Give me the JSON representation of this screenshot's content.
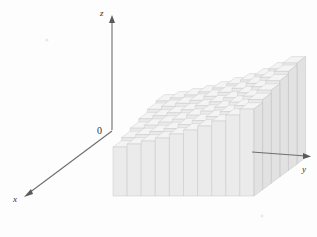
{
  "figure": {
    "background_color": "#fdfdfd",
    "width": 317,
    "height": 237
  },
  "axes": {
    "origin_label": "0",
    "origin_px": {
      "x": 112,
      "y": 130
    },
    "z": {
      "label": "z",
      "label_px": {
        "x": 103,
        "y": 13
      },
      "from_px": {
        "x": 112,
        "y": 130
      },
      "to_px": {
        "x": 112,
        "y": 18
      },
      "arrow": "up"
    },
    "y": {
      "label": "y",
      "label_px": {
        "x": 305,
        "y": 170
      },
      "from_px": {
        "x": 253,
        "y": 152
      },
      "to_px": {
        "x": 311,
        "y": 156
      },
      "arrow": "right"
    },
    "x": {
      "label": "x",
      "label_px": {
        "x": 16,
        "y": 200
      },
      "from_px": {
        "x": 112,
        "y": 131
      },
      "to_px": {
        "x": 25,
        "y": 196
      },
      "arrow": "down-left"
    }
  },
  "solid": {
    "type": "stepped-column-grid",
    "columns_along_y": 10,
    "rows_along_x": 6,
    "front_face_color": "#ebebeb",
    "top_face_color": "#f4f4f4",
    "side_face_color": "#e2e2e2",
    "edge_color": "#c4c4c4",
    "projection": {
      "y_step_px": {
        "dx": 14.1,
        "dy": 0.0
      },
      "x_step_px": {
        "dx": -8.6,
        "dy": 6.4
      },
      "base_front_left_px": {
        "x": 113,
        "y": 196
      },
      "base_top_y_px": 130
    },
    "comment": "Heights rise toward the back and to the right, approximating a smooth surface."
  },
  "chart_data": {
    "type": "bar",
    "xlabel": "x",
    "ylabel": "y",
    "zlabel": "z",
    "categories_y": [
      "1",
      "2",
      "3",
      "4",
      "5",
      "6",
      "7",
      "8",
      "9",
      "10"
    ],
    "categories_x": [
      "1",
      "2",
      "3",
      "4",
      "5",
      "6"
    ],
    "heights_grid": [
      [
        63,
        66,
        69,
        72,
        76,
        80,
        84,
        89,
        95,
        101
      ],
      [
        61,
        64,
        67,
        70,
        74,
        78,
        82,
        87,
        93,
        99
      ],
      [
        58,
        61,
        64,
        67,
        71,
        75,
        79,
        84,
        90,
        96
      ],
      [
        55,
        58,
        61,
        64,
        68,
        72,
        76,
        81,
        87,
        93
      ],
      [
        52,
        55,
        58,
        61,
        65,
        69,
        73,
        78,
        84,
        90
      ],
      [
        49,
        52,
        55,
        58,
        62,
        66,
        70,
        75,
        81,
        87
      ]
    ],
    "zlim": [
      0,
      110
    ],
    "grid": false,
    "legend": "none"
  }
}
